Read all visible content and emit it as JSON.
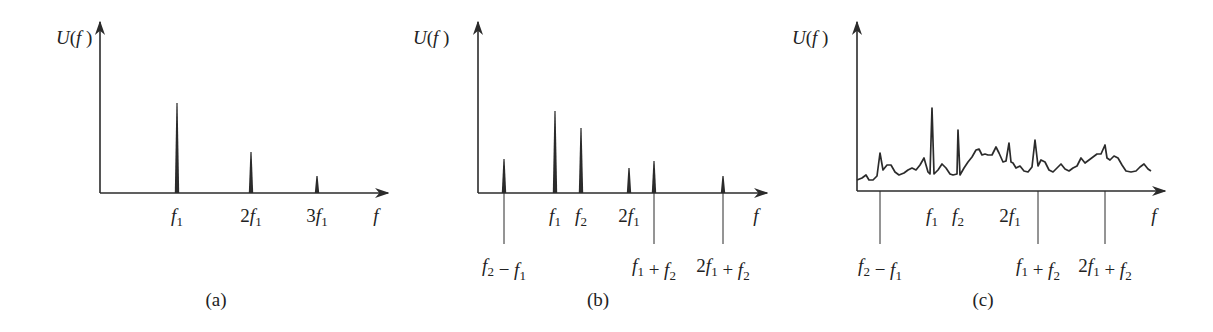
{
  "figure": {
    "panels": [
      {
        "id": "a",
        "caption": "(a)",
        "y_axis_label": "U(f)",
        "x_axis_label": "f",
        "axes": {
          "x0": 100,
          "y_axis_top": 22,
          "x_axis_y": 193,
          "x_axis_end": 388
        },
        "caption_pos": [
          216,
          306
        ],
        "ylabel_pos": [
          64,
          46
        ],
        "xlabel_pos": [
          376,
          222
        ],
        "peaks": [
          {
            "x": 177,
            "top": 103,
            "label": "f1",
            "label_pos": "above",
            "label_y": 222
          },
          {
            "x": 251,
            "top": 152,
            "label": "2f1",
            "label_pos": "above",
            "label_y": 222
          },
          {
            "x": 317,
            "top": 176,
            "label": "3f1",
            "label_pos": "above",
            "label_y": 222
          }
        ]
      },
      {
        "id": "b",
        "caption": "(b)",
        "y_axis_label": "U(f)",
        "x_axis_label": "f",
        "axes": {
          "x0": 478,
          "y_axis_top": 22,
          "x_axis_y": 193,
          "x_axis_end": 767
        },
        "caption_pos": [
          598,
          306
        ],
        "ylabel_pos": [
          421,
          46
        ],
        "xlabel_pos": [
          756,
          222
        ],
        "peaks": [
          {
            "x": 504,
            "top": 159,
            "label": "f2 − f1",
            "label_pos": "below",
            "line_to": 244,
            "label_y": 272
          },
          {
            "x": 555,
            "top": 111,
            "label": "f1",
            "label_pos": "above",
            "label_y": 222
          },
          {
            "x": 581,
            "top": 128,
            "label": "f2",
            "label_pos": "above",
            "label_y": 222
          },
          {
            "x": 629,
            "top": 168,
            "label": "2f1",
            "label_pos": "above",
            "label_y": 222
          },
          {
            "x": 654,
            "top": 161,
            "label": "f1 + f2",
            "label_pos": "below",
            "line_to": 244,
            "label_y": 272
          },
          {
            "x": 723,
            "top": 176,
            "label": "2f1 + f2",
            "label_pos": "below",
            "line_to": 244,
            "label_y": 272
          }
        ]
      },
      {
        "id": "c",
        "caption": "(c)",
        "y_axis_label": "U(f)",
        "x_axis_label": "f",
        "axes": {
          "x0": 857,
          "y_axis_top": 22,
          "x_axis_y": 191,
          "x_axis_end": 1165
        },
        "caption_pos": [
          983,
          306
        ],
        "ylabel_pos": [
          800,
          46
        ],
        "xlabel_pos": [
          1154,
          222
        ],
        "spectrum_type": "continuous noisy spectrum with peaks",
        "labels": [
          {
            "x": 880,
            "label": "f2 − f1",
            "label_pos": "below",
            "line_to": 244,
            "label_y": 272
          },
          {
            "x": 932,
            "label": "f1",
            "label_pos": "above",
            "label_y": 222
          },
          {
            "x": 958,
            "label": "f2",
            "label_pos": "above",
            "label_y": 222
          },
          {
            "x": 1010,
            "label": "2f1",
            "label_pos": "above",
            "label_y": 222
          },
          {
            "x": 1038,
            "label": "f1 + f2",
            "label_pos": "below",
            "line_to": 244,
            "label_y": 272
          },
          {
            "x": 1105,
            "label": "2f1 + f2",
            "label_pos": "below",
            "line_to": 244,
            "label_y": 272
          }
        ],
        "curve_points": [
          [
            857,
            180
          ],
          [
            862,
            178
          ],
          [
            866,
            175
          ],
          [
            869,
            180
          ],
          [
            873,
            180
          ],
          [
            877,
            176
          ],
          [
            880,
            153
          ],
          [
            883,
            170
          ],
          [
            887,
            165
          ],
          [
            891,
            165
          ],
          [
            895,
            172
          ],
          [
            899,
            175
          ],
          [
            904,
            173
          ],
          [
            908,
            170
          ],
          [
            912,
            168
          ],
          [
            916,
            170
          ],
          [
            920,
            165
          ],
          [
            924,
            158
          ],
          [
            928,
            172
          ],
          [
            930,
            174
          ],
          [
            932,
            108
          ],
          [
            934,
            174
          ],
          [
            938,
            170
          ],
          [
            942,
            164
          ],
          [
            946,
            168
          ],
          [
            950,
            174
          ],
          [
            953,
            175
          ],
          [
            957,
            174
          ],
          [
            958,
            130
          ],
          [
            960,
            175
          ],
          [
            964,
            168
          ],
          [
            968,
            162
          ],
          [
            972,
            157
          ],
          [
            976,
            150
          ],
          [
            979,
            149
          ],
          [
            982,
            155
          ],
          [
            985,
            154
          ],
          [
            988,
            155
          ],
          [
            992,
            155
          ],
          [
            996,
            147
          ],
          [
            999,
            153
          ],
          [
            1003,
            162
          ],
          [
            1006,
            161
          ],
          [
            1009,
            143
          ],
          [
            1011,
            162
          ],
          [
            1013,
            163
          ],
          [
            1016,
            168
          ],
          [
            1020,
            166
          ],
          [
            1024,
            171
          ],
          [
            1028,
            172
          ],
          [
            1032,
            167
          ],
          [
            1035,
            140
          ],
          [
            1038,
            166
          ],
          [
            1041,
            160
          ],
          [
            1045,
            162
          ],
          [
            1049,
            170
          ],
          [
            1053,
            172
          ],
          [
            1057,
            168
          ],
          [
            1061,
            164
          ],
          [
            1065,
            169
          ],
          [
            1069,
            171
          ],
          [
            1073,
            168
          ],
          [
            1077,
            166
          ],
          [
            1081,
            158
          ],
          [
            1085,
            163
          ],
          [
            1089,
            160
          ],
          [
            1093,
            157
          ],
          [
            1097,
            154
          ],
          [
            1101,
            154
          ],
          [
            1105,
            145
          ],
          [
            1107,
            158
          ],
          [
            1110,
            160
          ],
          [
            1114,
            156
          ],
          [
            1118,
            158
          ],
          [
            1122,
            165
          ],
          [
            1126,
            171
          ],
          [
            1131,
            172
          ],
          [
            1136,
            171
          ],
          [
            1140,
            167
          ],
          [
            1144,
            164
          ],
          [
            1148,
            169
          ],
          [
            1151,
            171
          ]
        ]
      }
    ],
    "colors": {
      "ink": "#2b2b2b",
      "background": "#ffffff"
    }
  }
}
